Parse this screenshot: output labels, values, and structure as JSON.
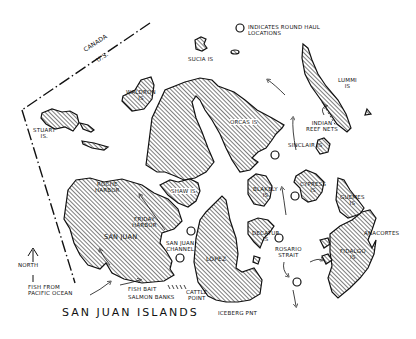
{
  "map": {
    "title": "SAN JUAN ISLANDS",
    "legend": {
      "symbol": "circle",
      "text_line1": "INDICATES ROUND HAUL",
      "text_line2": "LOCATIONS"
    },
    "border": {
      "north_label": "CANADA",
      "south_label": "U.S."
    },
    "north_arrow": {
      "label": "NORTH"
    },
    "islands": [
      {
        "name": "SUCIA IS",
        "line1": "SUCIA IS"
      },
      {
        "name": "WALDRON IS",
        "line1": "WALDRON",
        "line2": "IS"
      },
      {
        "name": "STUART IS",
        "line1": "STUART",
        "line2": "IS."
      },
      {
        "name": "ORCAS IS",
        "line1": "ORCAS IS"
      },
      {
        "name": "LUMMI IS",
        "line1": "LUMMI",
        "line2": "IS"
      },
      {
        "name": "SHAW IS",
        "line1": "SHAW IS"
      },
      {
        "name": "SAN JUAN",
        "line1": "SAN JUAN"
      },
      {
        "name": "LOPEZ",
        "line1": "LOPEZ"
      },
      {
        "name": "BLAKELY IS",
        "line1": "BLAKELY",
        "line2": "IS"
      },
      {
        "name": "CYPRESS IS",
        "line1": "CYPRESS",
        "line2": "IS"
      },
      {
        "name": "GUEMES IS",
        "line1": "GUEMES",
        "line2": "IS"
      },
      {
        "name": "DECATUR IS",
        "line1": "DECATUR",
        "line2": "IS"
      },
      {
        "name": "FIDALGO IS",
        "line1": "FIDALGO",
        "line2": "IS"
      },
      {
        "name": "SINCLAIR IS",
        "line1": "SINCLAIR IS"
      }
    ],
    "places": {
      "roche_harbor": {
        "line1": "ROCHE",
        "line2": "HARBOR"
      },
      "friday_harbor": {
        "line1": "FRIDAY",
        "line2": "HARBOR"
      },
      "san_juan_channel": {
        "line1": "SAN JUAN",
        "line2": "CHANNEL"
      },
      "rosario_strait": {
        "line1": "ROSARIO",
        "line2": "STRAIT"
      },
      "cattle_point": {
        "line1": "CATTLE",
        "line2": "POINT"
      },
      "iceberg_point": {
        "line1": "ICEBERG PNT"
      },
      "anacortes": {
        "line1": "ANACORTES"
      },
      "indian_reef_nets": {
        "line1": "INDIAN",
        "line2": "REEF NETS"
      },
      "fish_from_pacific": {
        "line1": "FISH FROM",
        "line2": "PACIFIC OCEAN"
      },
      "fish_bait": {
        "line1": "FISH BAIT"
      },
      "salmon_banks": {
        "line1": "SALMON BANKS"
      }
    },
    "round_haul_locations": [
      {
        "x": 275,
        "y": 155
      },
      {
        "x": 295,
        "y": 196
      },
      {
        "x": 191,
        "y": 231
      },
      {
        "x": 279,
        "y": 238
      },
      {
        "x": 180,
        "y": 258
      },
      {
        "x": 297,
        "y": 282
      }
    ],
    "colors": {
      "ink": "#111111",
      "paper": "#ffffff"
    }
  }
}
